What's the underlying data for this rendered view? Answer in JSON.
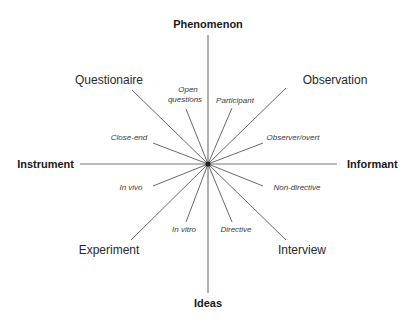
{
  "diagram": {
    "type": "radial-spoke-diagram",
    "center": {
      "x": 208,
      "y": 164
    },
    "axes": {
      "top": "Phenomenon",
      "bottom": "Ideas",
      "left": "Instrument",
      "right": "Informant"
    },
    "methods": {
      "upper_left": "Questionaire",
      "upper_right": "Observation",
      "lower_left": "Experiment",
      "lower_right": "Interview"
    },
    "sub_labels": {
      "open_questions_line1": "Open",
      "open_questions_line2": "questions",
      "close_end": "Close-end",
      "participant": "Participant",
      "observer_overt": "Observer/overt",
      "in_vivo": "In vivo",
      "in_vitro": "In vitro",
      "non_directive": "Non-directive",
      "directive": "Directive"
    },
    "colors": {
      "axis_line": "#7a7a7a",
      "spoke": "#6a6a6a",
      "center_dot": "#222222",
      "text": "#1a1a1a"
    }
  }
}
